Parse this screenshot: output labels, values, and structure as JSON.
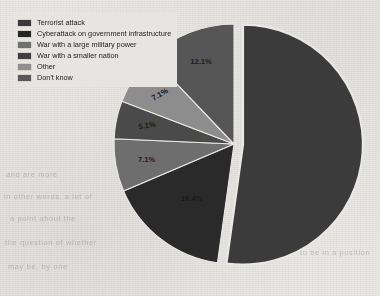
{
  "chart_data": {
    "type": "pie",
    "title": "",
    "legend_position": "top-left",
    "grid": false,
    "exploded_slice_index": 0,
    "categories": [
      "Terrorist attack",
      "Cyberattack on government infrastructure",
      "War with a large military power",
      "War with a smaller nation",
      "Other",
      "Don't know"
    ],
    "values": [
      52.2,
      16.4,
      7.1,
      5.1,
      7.1,
      12.1
    ],
    "labels": [
      "",
      "16.4%",
      "7.1%",
      "5.1%",
      "7.1%",
      "12.1%"
    ],
    "colors": [
      "#3b3b3b",
      "#2a2a2a",
      "#6e6e6e",
      "#4a4a4a",
      "#8d8d8d",
      "#565656"
    ],
    "label_colors": [
      "#1a1a1a",
      "#1b1b1b",
      "#1c1c1c",
      "#1c1c1c",
      "#151515",
      "#1c1c1c"
    ]
  },
  "legend": {
    "items": [
      {
        "label": "Terrorist attack",
        "color": "#3a3a3a"
      },
      {
        "label": "Cyberattack on government infrastructure",
        "color": "#262626"
      },
      {
        "label": "War with a large military power",
        "color": "#707070"
      },
      {
        "label": "War with a smaller nation",
        "color": "#3f3f3f"
      },
      {
        "label": "Other",
        "color": "#8f8f8f"
      },
      {
        "label": "Don't know",
        "color": "#595959"
      }
    ]
  },
  "background": {
    "page_color": "#e9e8e4",
    "legend_panel_color": "#e6e5e1",
    "bleed_text": [
      "and are more",
      "in other words, a lot of",
      "a point about the",
      "the question of whether",
      "may be, by one",
      "to be in a position"
    ]
  }
}
